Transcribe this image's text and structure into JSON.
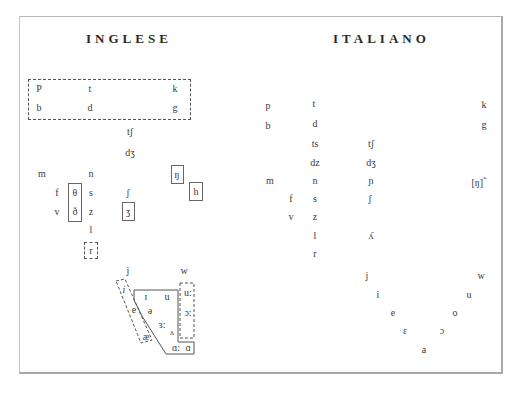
{
  "english": {
    "title": "INGLESE",
    "stops_row1": [
      "P",
      "t",
      "k"
    ],
    "stops_row2": [
      "b",
      "d",
      "g"
    ],
    "affricates": [
      "tʃ",
      "dʒ"
    ],
    "nasals": [
      "m",
      "n",
      "ŋ"
    ],
    "fricatives_voiceless": [
      "f",
      "θ",
      "s",
      "ʃ",
      "h"
    ],
    "fricatives_voiced": [
      "v",
      "ð",
      "z",
      "ʒ"
    ],
    "lateral": "l",
    "rhotic": "r",
    "glides": [
      "j",
      "w"
    ],
    "vowels": {
      "front_dashed": [
        "i",
        "e",
        "æ"
      ],
      "lax": [
        "ɪ",
        "u",
        "ə",
        "ɜ:",
        "ʌ"
      ],
      "back_dashed": [
        "u:",
        "ɔ:"
      ],
      "low_back": [
        "ɑ:",
        "ɑ"
      ]
    }
  },
  "italian": {
    "title": "ITALIANO",
    "stops_row1": [
      "p",
      "t",
      "k"
    ],
    "stops_row2": [
      "b",
      "d",
      "g"
    ],
    "affricates_dental": [
      "ts",
      "dz"
    ],
    "affricates_palatal": [
      "tʃ",
      "dʒ"
    ],
    "nasals": [
      "m",
      "n",
      "ɲ"
    ],
    "velar_nasal": "[ŋ]",
    "velar_nasal_note": "*",
    "fricatives_voiceless": [
      "f",
      "s",
      "ʃ"
    ],
    "fricatives_voiced": [
      "v",
      "z"
    ],
    "laterals": [
      "l",
      "ʎ"
    ],
    "rhotic": "r",
    "glides": [
      "j",
      "w"
    ],
    "vowels_front": [
      "i",
      "e",
      "ɛ"
    ],
    "vowels_back": [
      "u",
      "o",
      "ɔ"
    ],
    "vowel_low": "a"
  }
}
